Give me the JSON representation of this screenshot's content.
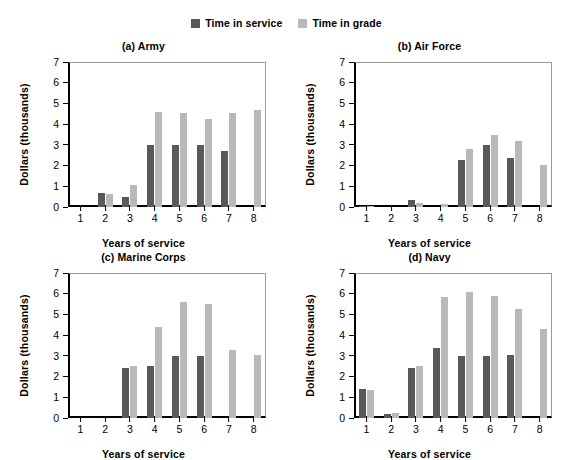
{
  "legend": {
    "items": [
      {
        "label": "Time in service",
        "color": "#595959",
        "icon": "legend-swatch-icon"
      },
      {
        "label": "Time in grade",
        "color": "#b9b9b9",
        "icon": "legend-swatch-icon"
      }
    ]
  },
  "axis": {
    "ylabel": "Dollars (thousands)",
    "xlabel": "Years of service",
    "yticks": [
      "0",
      "1",
      "2",
      "3",
      "4",
      "5",
      "6",
      "7"
    ],
    "xticks": [
      "1",
      "2",
      "3",
      "4",
      "5",
      "6",
      "7",
      "8"
    ]
  },
  "panels": [
    {
      "key": "army",
      "title": "(a) Army"
    },
    {
      "key": "air_force",
      "title": "(b) Air Force"
    },
    {
      "key": "marine_corps",
      "title": "(c) Marine Corps"
    },
    {
      "key": "navy",
      "title": "(d) Navy"
    }
  ],
  "chart_data": [
    {
      "type": "bar",
      "title": "(a) Army",
      "xlabel": "Years of service",
      "ylabel": "Dollars (thousands)",
      "categories": [
        "1",
        "2",
        "3",
        "4",
        "5",
        "6",
        "7",
        "8"
      ],
      "ylim": [
        0,
        7
      ],
      "yticks": [
        0,
        1,
        2,
        3,
        4,
        5,
        6,
        7
      ],
      "grid": false,
      "legend_position": "top-center",
      "series": [
        {
          "name": "Time in service",
          "color": "#595959",
          "values": [
            0,
            0.68,
            0.5,
            2.97,
            3.0,
            3.0,
            2.72,
            0
          ]
        },
        {
          "name": "Time in grade",
          "color": "#b9b9b9",
          "values": [
            0,
            0.62,
            1.05,
            4.58,
            4.55,
            4.27,
            4.52,
            4.68
          ]
        }
      ]
    },
    {
      "type": "bar",
      "title": "(b) Air Force",
      "xlabel": "Years of service",
      "ylabel": "Dollars (thousands)",
      "categories": [
        "1",
        "2",
        "3",
        "4",
        "5",
        "6",
        "7",
        "8"
      ],
      "ylim": [
        0,
        7
      ],
      "yticks": [
        0,
        1,
        2,
        3,
        4,
        5,
        6,
        7
      ],
      "grid": false,
      "legend_position": "top-center",
      "series": [
        {
          "name": "Time in service",
          "color": "#595959",
          "values": [
            0.07,
            0,
            0.33,
            0,
            2.25,
            3.0,
            2.38,
            0
          ]
        },
        {
          "name": "Time in grade",
          "color": "#b9b9b9",
          "values": [
            0.06,
            0,
            0.2,
            0.16,
            2.78,
            3.5,
            3.17,
            2.03
          ]
        }
      ]
    },
    {
      "type": "bar",
      "title": "(c) Marine Corps",
      "xlabel": "Years of service",
      "ylabel": "Dollars (thousands)",
      "categories": [
        "1",
        "2",
        "3",
        "4",
        "5",
        "6",
        "7",
        "8"
      ],
      "ylim": [
        0,
        7
      ],
      "yticks": [
        0,
        1,
        2,
        3,
        4,
        5,
        6,
        7
      ],
      "grid": false,
      "legend_position": "top-center",
      "series": [
        {
          "name": "Time in service",
          "color": "#595959",
          "values": [
            0,
            0,
            2.42,
            2.53,
            3.0,
            3.0,
            0,
            0
          ]
        },
        {
          "name": "Time in grade",
          "color": "#b9b9b9",
          "values": [
            0,
            0,
            2.5,
            4.4,
            5.62,
            5.5,
            3.3,
            3.02
          ]
        }
      ]
    },
    {
      "type": "bar",
      "title": "(d) Navy",
      "xlabel": "Years of service",
      "ylabel": "Dollars (thousands)",
      "categories": [
        "1",
        "2",
        "3",
        "4",
        "5",
        "6",
        "7",
        "8"
      ],
      "ylim": [
        0,
        7
      ],
      "yticks": [
        0,
        1,
        2,
        3,
        4,
        5,
        6,
        7
      ],
      "grid": false,
      "legend_position": "top-center",
      "series": [
        {
          "name": "Time in service",
          "color": "#595959",
          "values": [
            1.4,
            0.18,
            2.42,
            3.4,
            3.0,
            3.0,
            3.05,
            0
          ]
        },
        {
          "name": "Time in grade",
          "color": "#b9b9b9",
          "values": [
            1.37,
            0.22,
            2.5,
            5.82,
            6.08,
            5.9,
            5.28,
            4.3
          ]
        }
      ]
    }
  ]
}
